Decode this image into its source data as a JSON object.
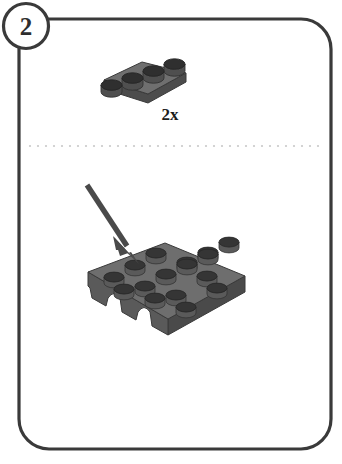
{
  "page": {
    "kind": "lego-building-instruction-step",
    "width": 342,
    "height": 464,
    "background_color": "#ffffff"
  },
  "step": {
    "number": "2",
    "badge_name": "step-number-badge",
    "badge_shape": "circle",
    "badge_fill": "#ffffff",
    "badge_stroke": "#3a3a3a"
  },
  "frame": {
    "name": "step-panel-border",
    "shape": "rounded-rectangle",
    "stroke": "#3a3a3a",
    "fill": "#ffffff",
    "corner_radius": 30,
    "x": 19,
    "y": 19,
    "width": 312,
    "height": 430
  },
  "divider": {
    "name": "dotted-separator",
    "style": "dotted",
    "color": "#c9c9c9",
    "y": 146,
    "x_start": 30,
    "x_end": 318,
    "dot_spacing": 8,
    "dot_radius": 1.1
  },
  "parts_bin": {
    "name": "parts-callout",
    "items": [
      {
        "name": "plate-1x4",
        "label": "2x",
        "quantity": 2,
        "studs": 4,
        "rows": 1,
        "columns": 4,
        "color_name": "dark-bluish-gray",
        "top_color": "#6f6f6f",
        "side_color": "#4f4f4f",
        "front_color": "#5c5c5c",
        "stud_top_color": "#2f2f2f",
        "stud_side_color": "#555555",
        "outline_color": "#3d3d3d",
        "label_color": "#1c1c1c"
      }
    ]
  },
  "assembly": {
    "name": "assembly-target",
    "items": [
      {
        "name": "plate-4x4-with-arches",
        "studs": 16,
        "rows": 4,
        "columns": 4,
        "color_name": "dark-bluish-gray",
        "top_color": "#6e6e6e",
        "side_color": "#4a4a4a",
        "front_color": "#595959",
        "stud_top_color": "#353535",
        "stud_side_color": "#5a5a5a",
        "outline_color": "#3a3a3a",
        "cutouts": 3,
        "cutout_shape": "arch"
      }
    ]
  },
  "placement_arrow": {
    "name": "placement-arrow",
    "color": "#4a4a4a",
    "from_x": 87,
    "from_y": 185,
    "to_x": 138,
    "to_y": 263,
    "shaft_width": 5,
    "head_length": 22,
    "head_width": 19,
    "direction": "down-right"
  }
}
